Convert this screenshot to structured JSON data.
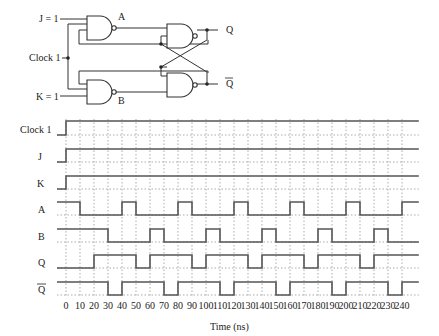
{
  "circuit": {
    "inputs": {
      "j": "J = 1",
      "clock": "Clock 1",
      "k": "K = 1"
    },
    "nodes": {
      "a": "A",
      "b": "B"
    },
    "outputs": {
      "q": "Q",
      "q_bar": "Q"
    }
  },
  "timing": {
    "signals": [
      {
        "name": "Clock 1",
        "overbar": false
      },
      {
        "name": "J",
        "overbar": false
      },
      {
        "name": "K",
        "overbar": false
      },
      {
        "name": "A",
        "overbar": false
      },
      {
        "name": "B",
        "overbar": false
      },
      {
        "name": "Q",
        "overbar": false
      },
      {
        "name": "Q",
        "overbar": true
      }
    ],
    "ticks": [
      "0",
      "10",
      "20",
      "30",
      "40",
      "50",
      "60",
      "70",
      "80",
      "90",
      "100",
      "110",
      "120",
      "130",
      "140",
      "150",
      "160",
      "170",
      "180",
      "190",
      "200",
      "210",
      "220",
      "230",
      "240"
    ],
    "xlabel": "Time (ns)",
    "waveforms": {
      "clock": [
        [
          -7,
          0
        ],
        [
          0,
          1
        ]
      ],
      "j": [
        [
          -7,
          0
        ],
        [
          0,
          1
        ]
      ],
      "k": [
        [
          -7,
          0
        ],
        [
          0,
          1
        ]
      ],
      "a": [
        [
          -7,
          1
        ],
        [
          10,
          0
        ],
        [
          40,
          1
        ],
        [
          50,
          0
        ],
        [
          80,
          1
        ],
        [
          90,
          0
        ],
        [
          120,
          1
        ],
        [
          130,
          0
        ],
        [
          160,
          1
        ],
        [
          170,
          0
        ],
        [
          200,
          1
        ],
        [
          210,
          0
        ],
        [
          240,
          1
        ]
      ],
      "b": [
        [
          -7,
          1
        ],
        [
          30,
          0
        ],
        [
          60,
          1
        ],
        [
          70,
          0
        ],
        [
          100,
          1
        ],
        [
          110,
          0
        ],
        [
          140,
          1
        ],
        [
          150,
          0
        ],
        [
          180,
          1
        ],
        [
          190,
          0
        ],
        [
          220,
          1
        ],
        [
          230,
          0
        ]
      ],
      "q": [
        [
          -7,
          0
        ],
        [
          20,
          1
        ],
        [
          50,
          0
        ],
        [
          60,
          1
        ],
        [
          90,
          0
        ],
        [
          100,
          1
        ],
        [
          130,
          0
        ],
        [
          140,
          1
        ],
        [
          170,
          0
        ],
        [
          180,
          1
        ],
        [
          210,
          0
        ],
        [
          220,
          1
        ]
      ],
      "q_bar": [
        [
          -7,
          1
        ],
        [
          30,
          0
        ],
        [
          40,
          1
        ],
        [
          70,
          0
        ],
        [
          80,
          1
        ],
        [
          110,
          0
        ],
        [
          120,
          1
        ],
        [
          150,
          0
        ],
        [
          160,
          1
        ],
        [
          190,
          0
        ],
        [
          200,
          1
        ],
        [
          230,
          0
        ],
        [
          240,
          1
        ]
      ]
    },
    "end_time": 252
  }
}
